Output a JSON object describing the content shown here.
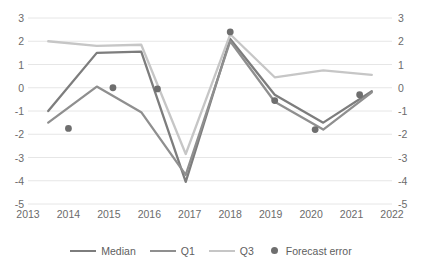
{
  "chart_data": {
    "type": "line",
    "title": "",
    "xlabel": "",
    "ylabel": "",
    "xlim": [
      2013,
      2022
    ],
    "ylim": [
      -5,
      3
    ],
    "y_ticks": [
      3,
      2,
      1,
      0,
      -1,
      -2,
      -3,
      -4,
      -5
    ],
    "x_ticks": [
      2013,
      2014,
      2015,
      2016,
      2017,
      2018,
      2019,
      2020,
      2021,
      2022
    ],
    "grid": true,
    "dual_axis": true,
    "right_axis_ticks": [
      3,
      2,
      1,
      0,
      -1,
      -2,
      -3,
      -4,
      -5
    ],
    "legend_position": "bottom",
    "x": [
      2013.5,
      2014.7,
      2015.8,
      2016.9,
      2018.0,
      2019.1,
      2020.3,
      2021.5
    ],
    "series": [
      {
        "name": "Median",
        "type": "line",
        "color": "#7d7d7d",
        "values": [
          -1.0,
          1.5,
          1.55,
          -4.05,
          2.1,
          -0.3,
          -1.5,
          -0.15
        ]
      },
      {
        "name": "Q1",
        "type": "line",
        "color": "#8f8f8f",
        "values": [
          -1.5,
          0.05,
          -1.05,
          -3.75,
          2.0,
          -0.6,
          -1.8,
          -0.2
        ]
      },
      {
        "name": "Q3",
        "type": "line",
        "color": "#c6c6c6",
        "values": [
          2.0,
          1.8,
          1.85,
          -2.85,
          2.3,
          0.45,
          0.75,
          0.55
        ]
      },
      {
        "name": "Forecast error",
        "type": "scatter",
        "color": "#6e6e6e",
        "x": [
          2014.0,
          2015.1,
          2016.2,
          2018.0,
          2019.1,
          2020.1,
          2021.2
        ],
        "values": [
          -1.75,
          0.0,
          -0.05,
          2.4,
          -0.55,
          -1.8,
          -0.3
        ]
      }
    ]
  },
  "axes": {
    "left_labels": [
      "3",
      "2",
      "1",
      "0",
      "-1",
      "-2",
      "-3",
      "-4",
      "-5"
    ],
    "right_labels": [
      "3",
      "2",
      "1",
      "0",
      "-1",
      "-2",
      "-3",
      "-4",
      "-5"
    ],
    "x_labels": [
      "2013",
      "2014",
      "2015",
      "2016",
      "2017",
      "2018",
      "2019",
      "2020",
      "2021",
      "2022"
    ]
  },
  "legend": {
    "items": [
      {
        "label": "Median",
        "marker": "line",
        "color": "#7d7d7d"
      },
      {
        "label": "Q1",
        "marker": "line",
        "color": "#8f8f8f"
      },
      {
        "label": "Q3",
        "marker": "line",
        "color": "#c6c6c6"
      },
      {
        "label": "Forecast error",
        "marker": "dot",
        "color": "#6e6e6e"
      }
    ]
  },
  "style": {
    "gridline_color": "#e6e6e6",
    "tick_label_color": "#6b6b6b",
    "background": "#ffffff"
  }
}
